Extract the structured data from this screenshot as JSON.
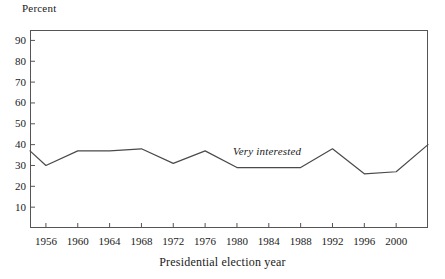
{
  "chart_data": {
    "type": "line",
    "title": "",
    "subtitle": "",
    "xlabel": "Presidential election year",
    "ylabel": "Percent",
    "grid": false,
    "legend_position": "inline-annotation",
    "xlim": [
      1954,
      2004
    ],
    "ylim": [
      0,
      95
    ],
    "yticks": [
      10,
      20,
      30,
      40,
      50,
      60,
      70,
      80,
      90
    ],
    "xticks": [
      1956,
      1960,
      1964,
      1968,
      1972,
      1976,
      1980,
      1984,
      1988,
      1992,
      1996,
      2000
    ],
    "x": [
      1954,
      1956,
      1960,
      1964,
      1968,
      1972,
      1976,
      1980,
      1984,
      1988,
      1992,
      1996,
      2000,
      2004
    ],
    "series": [
      {
        "name": "Very interested",
        "values": [
          37,
          30,
          37,
          37,
          38,
          31,
          37,
          29,
          29,
          29,
          38,
          26,
          27,
          40
        ],
        "color": "#4a4a4a",
        "annotation": "Very interested"
      }
    ]
  },
  "axes": {
    "y_title": "Percent",
    "x_title": "Presidential election year",
    "y_tick_labels": [
      "90",
      "80",
      "70",
      "60",
      "50",
      "40",
      "30",
      "20",
      "10"
    ],
    "x_tick_labels": [
      "1956",
      "1960",
      "1964",
      "1968",
      "1972",
      "1976",
      "1980",
      "1984",
      "1988",
      "1992",
      "1996",
      "2000"
    ]
  },
  "annotations": {
    "series_label": "Very interested"
  },
  "colors": {
    "line": "#4a4a4a",
    "frame": "#555555",
    "text": "#1a1a1a",
    "background": "#ffffff"
  }
}
